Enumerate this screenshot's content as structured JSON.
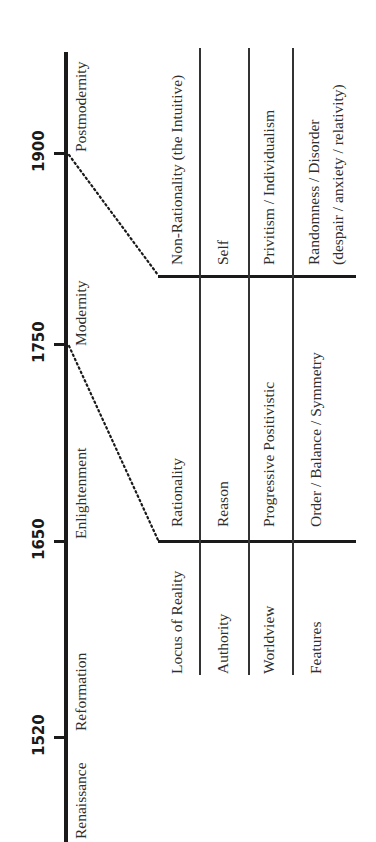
{
  "timeline": {
    "years": [
      {
        "label": "1900",
        "y": 153
      },
      {
        "label": "1750",
        "y": 344
      },
      {
        "label": "1650",
        "y": 541
      },
      {
        "label": "1520",
        "y": 737
      }
    ],
    "eras": [
      "Renaissance",
      "Reformation",
      "Enlightenment",
      "Modernity",
      "Postmodernity"
    ]
  },
  "table": {
    "row_labels": [
      "Locus of Reality",
      "Authority",
      "Worldview",
      "Features"
    ],
    "modernity": {
      "locus": "Rationality",
      "authority": "Reason",
      "worldview": "Progressive Positivistic",
      "features": "Order / Balance / Symmetry"
    },
    "postmodernity": {
      "locus": "Non-Rationality (the Intuitive)",
      "authority": "Self",
      "worldview": "Privitism / Individualism",
      "features_line1": "Randomness / Disorder",
      "features_line2": "(despair / anxiety / relativity)"
    }
  },
  "colors": {
    "ink": "#1a1a1a",
    "text": "#2f2f2f",
    "background": "#ffffff"
  }
}
